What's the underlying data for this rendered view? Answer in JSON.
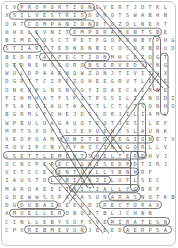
{
  "puzzle": {
    "type": "word-search",
    "rows": [
      "CVPROPORTIONEVERTJDTKL",
      "XSILVESTRISDOROTSWABHN",
      "OATCOMPANIONETOZDLNEXT",
      "HHDLEVNITEMPERAMENTSBE",
      "BIMEDOSCTPETFGOPONBFPHG",
      "STIARTTEDNDNBICOCORBRUD",
      "BEDRTAFFECTIONMHCEZOGT",
      "OZDNEHSGUROBSERVEDVVNG",
      "WULDPAAEHQWZONJTIVIIVX",
      "DGRTTCIPEZOHEEGRVTLEIE",
      "ONKUPLNSNVOYIDAECAIRNE",
      "FIHMHATFSFITPSSILIENODI",
      "FSAEQIAUTAATTLCTLTSONHO",
      "BGRMLFCHEJDSLDRJILIAML",
      "WPBULOAGAUQTOOTJESTLEF",
      "MRTSXOFILJEXUENTSLAUNK",
      "XEOPUAMOUNITEDREGIONETV",
      "ROVIPCNVXYHICINWGQRLLV",
      "LSETTLEMENTSHELTEREHVJ",
      "OCNCPIRECOGNISEDPDTIRJ",
      "VITCCEVENTUALLYBNHRF",
      "IAUSTOLYBICAZILUFLSEC",
      "MAROAEEIINITIALLYGBRF",
      "GDEWWSSPACASUNARASNOTKB",
      "DUDUBAIDEEDDIRECTORAX",
      "AMUELLERONOETBLJCHNN",
      "CINLLEBYSOFSVEMIRATESN",
      "CPXREBMEVONJEEEDAERPSA"
    ],
    "found_words": [
      "PROPORTION",
      "SILVESTRIS",
      "COMPANION",
      "TEMPERAMENTS",
      "START",
      "AFFECTION",
      "OBSERVED",
      "UNITEDREGION",
      "SETTLEMENT",
      "SHELTER",
      "RECOGNISED",
      "EVENTUALLY",
      "LIBYCA",
      "INITIALLY",
      "ARAB",
      "DUBAI",
      "DIRECTOR",
      "MUELLER",
      "EMIRATES",
      "NOVEMBER",
      "SPREAD"
    ],
    "colors": {
      "border": "#c8c8c8",
      "letter": "#6a6a6a",
      "found_letter": "#111111",
      "outline": "#555555"
    }
  }
}
